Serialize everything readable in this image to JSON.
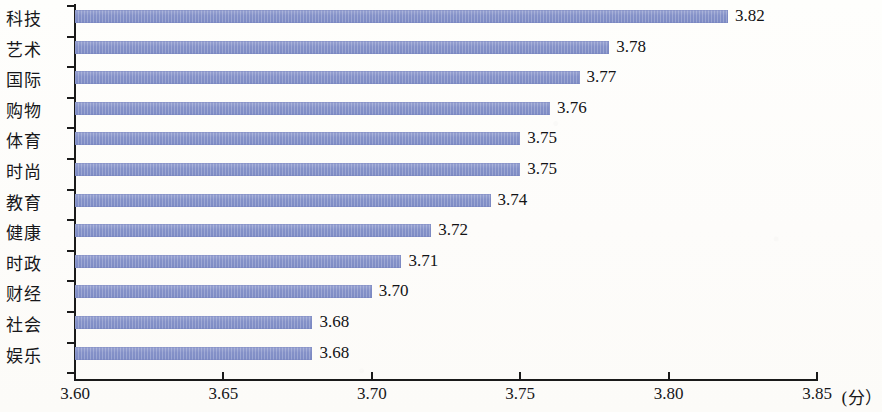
{
  "chart_data": {
    "type": "bar",
    "orientation": "horizontal",
    "title": "",
    "subtitle": "",
    "xlabel": "",
    "ylabel": "",
    "unit_label": "(分）",
    "xlim": [
      3.6,
      3.85
    ],
    "xticks": [
      "3.60",
      "3.65",
      "3.70",
      "3.75",
      "3.80",
      "3.85"
    ],
    "xtick_values": [
      3.6,
      3.65,
      3.7,
      3.75,
      3.8,
      3.85
    ],
    "grid": false,
    "legend": false,
    "bar_color": "#8491c8",
    "axis_color": "#1a1a1a",
    "text_color": "#17171a",
    "background_color": "#fdfdfb",
    "categories": [
      "科技",
      "艺术",
      "国际",
      "购物",
      "体育",
      "时尚",
      "教育",
      "健康",
      "时政",
      "财经",
      "社会",
      "娱乐"
    ],
    "values": [
      3.82,
      3.78,
      3.77,
      3.76,
      3.75,
      3.75,
      3.74,
      3.72,
      3.71,
      3.7,
      3.68,
      3.68
    ],
    "value_labels": [
      "3.82",
      "3.78",
      "3.77",
      "3.76",
      "3.75",
      "3.75",
      "3.74",
      "3.72",
      "3.71",
      "3.70",
      "3.68",
      "3.68"
    ]
  }
}
